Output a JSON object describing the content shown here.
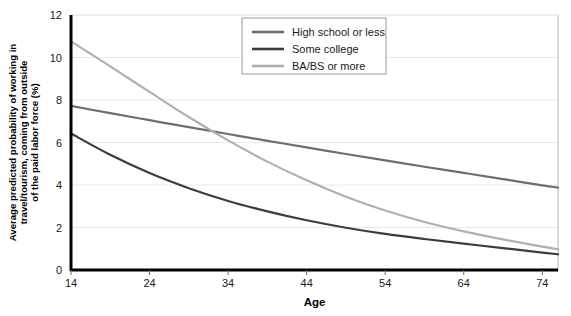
{
  "chart_data": {
    "type": "line",
    "title": "",
    "xlabel": "Age",
    "ylabel": "Average predicted probability of working in travel/tourism, coming from outside of the paid labor force (%)",
    "ylabel_lines": [
      "Average predicted probability of working in",
      "travel/tourism, coming from outside",
      "of the paid labor force (%)"
    ],
    "xlim": [
      14,
      76
    ],
    "ylim": [
      0,
      12
    ],
    "xticks": [
      14,
      24,
      34,
      44,
      54,
      64,
      74
    ],
    "yticks": [
      0,
      2,
      4,
      6,
      8,
      10,
      12
    ],
    "xtick_labels": [
      "14",
      "24",
      "34",
      "44",
      "54",
      "64",
      "74"
    ],
    "ytick_labels": [
      "0",
      "2",
      "4",
      "6",
      "8",
      "10",
      "12"
    ],
    "grid": "horizontal",
    "legend_position": "top-right",
    "x": [
      14,
      19,
      24,
      29,
      34,
      39,
      44,
      49,
      54,
      59,
      64,
      69,
      74,
      76
    ],
    "series": [
      {
        "name": "High school or less",
        "color": "#6e6e6e",
        "values": [
          7.72,
          7.38,
          7.05,
          6.72,
          6.4,
          6.08,
          5.77,
          5.46,
          5.16,
          4.86,
          4.57,
          4.28,
          3.98,
          3.88
        ]
      },
      {
        "name": "Some college",
        "color": "#3c3c3c",
        "values": [
          6.42,
          5.42,
          4.56,
          3.85,
          3.25,
          2.76,
          2.34,
          1.99,
          1.7,
          1.46,
          1.24,
          1.03,
          0.82,
          0.74
        ]
      },
      {
        "name": "BA/BS or more",
        "color": "#b0b0b0",
        "values": [
          10.76,
          9.58,
          8.38,
          7.2,
          6.1,
          5.1,
          4.22,
          3.45,
          2.8,
          2.26,
          1.82,
          1.44,
          1.1,
          0.98
        ]
      }
    ]
  },
  "legend": {
    "items": [
      {
        "label": "High school or less",
        "color": "#6e6e6e"
      },
      {
        "label": "Some college",
        "color": "#3c3c3c"
      },
      {
        "label": "BA/BS or more",
        "color": "#b0b0b0"
      }
    ]
  },
  "colors": {
    "axis": "#000000",
    "grid": "#e9e9e9",
    "plot_border": "#b5b5b5",
    "background": "#ffffff",
    "text": "#1a1a1a"
  }
}
